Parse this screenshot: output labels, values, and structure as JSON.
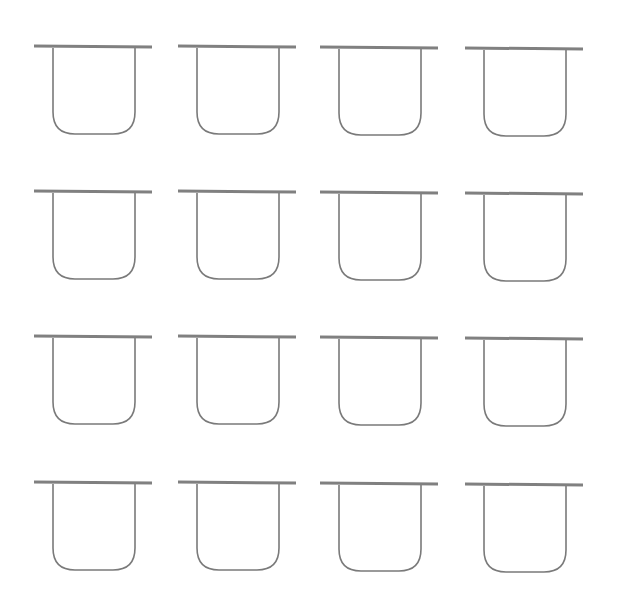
{
  "diagram": {
    "rows": 4,
    "columns": 4,
    "stroke_color": "#7a7a7a",
    "bar_color": "#808080",
    "column_x": [
      34,
      178,
      320,
      465
    ],
    "row_y": [
      46,
      191,
      336,
      482
    ],
    "column_y_offset": [
      0,
      0,
      1,
      2
    ],
    "bar_width": 118,
    "u_inset_left": 19,
    "u_width": 82,
    "u_height": 86,
    "u_corner_radius": 22,
    "shape": "u-shaped cup under horizontal bar"
  }
}
